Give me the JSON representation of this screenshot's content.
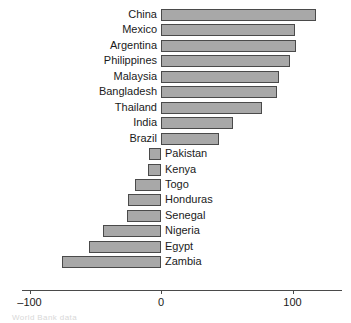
{
  "chart_data": {
    "type": "bar",
    "orientation": "horizontal",
    "title": "",
    "xlabel": "",
    "ylabel": "",
    "categories": [
      "China",
      "Mexico",
      "Argentina",
      "Philippines",
      "Malaysia",
      "Bangladesh",
      "Thailand",
      "India",
      "Brazil",
      "Pakistan",
      "Kenya",
      "Togo",
      "Honduras",
      "Senegal",
      "Nigeria",
      "Egypt",
      "Zambia"
    ],
    "values": [
      118,
      102,
      103,
      98,
      90,
      88,
      77,
      55,
      44,
      -9,
      -10,
      -20,
      -25,
      -26,
      -44,
      -55,
      -75
    ],
    "xlim": [
      -100,
      140
    ],
    "xticks": [
      -100,
      0,
      100
    ],
    "xticklabels": [
      "–100",
      "0",
      "100"
    ],
    "grid": false,
    "legend": null,
    "bar_fill_color": "#a8a8a8",
    "bar_edge_color": "#4a4a4a",
    "axis_color": "#4a4a4a",
    "text_color": "#1a1a1a"
  },
  "footnote": "World Bank data"
}
